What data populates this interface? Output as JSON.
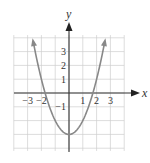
{
  "chart_data": {
    "type": "line",
    "title": "",
    "equation": "y = x^2 - 3",
    "xlabel": "x",
    "ylabel": "y",
    "xlim": [
      -4,
      4
    ],
    "ylim": [
      -4,
      4
    ],
    "grid": true,
    "x_tick_labels": [
      "-3",
      "-2",
      "1",
      "2",
      "3"
    ],
    "y_tick_labels": [
      "3",
      "2",
      "1",
      "-1"
    ],
    "series": [
      {
        "name": "parabola",
        "x": [
          -2.6,
          -2,
          -1.73,
          -1,
          0,
          1,
          1.73,
          2,
          2.6
        ],
        "y": [
          3.76,
          1,
          0,
          -2,
          -3,
          -2,
          0,
          1,
          3.76
        ]
      }
    ],
    "vertex": [
      0,
      -3
    ],
    "roots": [
      -1.73,
      1.73
    ]
  },
  "labels": {
    "x_axis": "x",
    "y_axis": "y",
    "xticks": [
      {
        "v": -3,
        "t": "−3"
      },
      {
        "v": -2,
        "t": "−2"
      },
      {
        "v": 1,
        "t": "1"
      },
      {
        "v": 2,
        "t": "2"
      },
      {
        "v": 3,
        "t": "3"
      }
    ],
    "yticks": [
      {
        "v": 3,
        "t": "3"
      },
      {
        "v": 2,
        "t": "2"
      },
      {
        "v": 1,
        "t": "1"
      },
      {
        "v": -1,
        "t": "−1"
      }
    ]
  }
}
